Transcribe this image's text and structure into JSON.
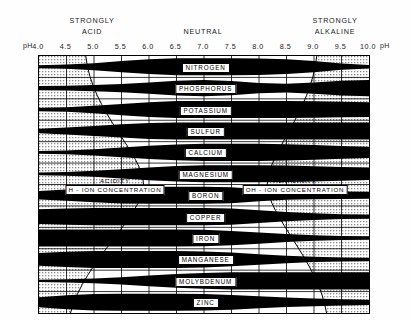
{
  "header": {
    "left_zone": "STRONGLY\nACID",
    "left_zone_line1": "STRONGLY",
    "left_zone_line2": "ACID",
    "center_zone": "NEUTRAL",
    "right_zone_line1": "STRONGLY",
    "right_zone_line2": "ALKALINE",
    "ph_label_left": "pH",
    "ph_label_right": "pH"
  },
  "axis": {
    "label": "pH",
    "ticks": [
      "4.0",
      "4.5",
      "5.0",
      "5.5",
      "6.0",
      "6.5",
      "7.0",
      "7.5",
      "8.0",
      "8.5",
      "9.0",
      "9.5",
      "10.0"
    ],
    "min": 4.0,
    "max": 10.0,
    "step": 0.5
  },
  "bands": [
    {
      "name": "NITROGEN",
      "label": "NITROGEN"
    },
    {
      "name": "PHOSPHORUS",
      "label": "PHOSPHORUS"
    },
    {
      "name": "POTASSIUM",
      "label": "POTASSIUM"
    },
    {
      "name": "SULFUR",
      "label": "SULFUR"
    },
    {
      "name": "CALCIUM",
      "label": "CALCIUM"
    },
    {
      "name": "MAGNESIUM",
      "label": "MAGNESIUM"
    },
    {
      "name": "BORON",
      "label": "BORON"
    },
    {
      "name": "COPPER",
      "label": "COPPER"
    },
    {
      "name": "IRON",
      "label": "IRON"
    },
    {
      "name": "MANGANESE",
      "label": "MANGANESE"
    },
    {
      "name": "MOLYBDENUM",
      "label": "MOLYBDENUM"
    },
    {
      "name": "ZINC",
      "label": "ZINC"
    }
  ],
  "legend": {
    "acidity": "ACIDITY",
    "h_ion": "H - ION CONCENTRATION",
    "alkalinity": "ALKALINITY",
    "oh_ion": "OH - ION CONCENTRATION"
  },
  "colors": {
    "band_fill": "#000000",
    "stipple": "#b9b9b9",
    "background": "#ffffff",
    "text": "#000000"
  },
  "chart_data": {
    "type": "area",
    "xlabel": "pH",
    "ylabel": "",
    "xlim": [
      4.0,
      10.0
    ],
    "grid": true,
    "legend_position": "none",
    "note": "Band thickness indicates relative availability of each plant nutrient at a given soil pH. Wider (thicker) black band = greater availability.",
    "x": [
      4.0,
      4.5,
      5.0,
      5.5,
      6.0,
      6.5,
      7.0,
      7.5,
      8.0,
      8.5,
      9.0,
      9.5,
      10.0
    ],
    "series": [
      {
        "name": "NITROGEN",
        "values": [
          0.1,
          0.18,
          0.35,
          0.62,
          0.85,
          1.0,
          1.0,
          1.0,
          0.95,
          0.85,
          0.62,
          0.3,
          0.12
        ]
      },
      {
        "name": "PHOSPHORUS",
        "values": [
          0.18,
          0.22,
          0.3,
          0.42,
          0.62,
          0.85,
          0.95,
          0.8,
          0.55,
          0.45,
          0.62,
          0.85,
          0.95
        ]
      },
      {
        "name": "POTASSIUM",
        "values": [
          0.12,
          0.2,
          0.38,
          0.62,
          0.85,
          1.0,
          1.0,
          1.0,
          1.0,
          1.0,
          0.95,
          0.9,
          0.85
        ]
      },
      {
        "name": "SULFUR",
        "values": [
          0.2,
          0.35,
          0.55,
          0.75,
          0.92,
          1.0,
          1.0,
          1.0,
          1.0,
          1.0,
          1.0,
          1.0,
          1.0
        ]
      },
      {
        "name": "CALCIUM",
        "values": [
          0.08,
          0.15,
          0.3,
          0.52,
          0.75,
          0.92,
          1.0,
          1.0,
          1.0,
          0.95,
          0.85,
          0.72,
          0.62
        ]
      },
      {
        "name": "MAGNESIUM",
        "values": [
          0.08,
          0.14,
          0.28,
          0.5,
          0.72,
          0.9,
          1.0,
          1.0,
          1.0,
          0.95,
          0.88,
          0.78,
          0.7
        ]
      },
      {
        "name": "BORON",
        "values": [
          0.45,
          0.62,
          0.8,
          0.95,
          1.0,
          1.0,
          1.0,
          0.92,
          0.68,
          0.5,
          0.42,
          0.38,
          0.35
        ]
      },
      {
        "name": "COPPER",
        "values": [
          0.85,
          0.95,
          1.0,
          1.0,
          1.0,
          1.0,
          1.0,
          0.95,
          0.72,
          0.48,
          0.32,
          0.22,
          0.18
        ]
      },
      {
        "name": "IRON",
        "values": [
          1.0,
          1.0,
          1.0,
          1.0,
          1.0,
          1.0,
          0.95,
          0.82,
          0.62,
          0.42,
          0.26,
          0.16,
          0.12
        ]
      },
      {
        "name": "MANGANESE",
        "values": [
          0.72,
          0.88,
          1.0,
          1.0,
          1.0,
          1.0,
          0.92,
          0.78,
          0.58,
          0.38,
          0.24,
          0.16,
          0.12
        ]
      },
      {
        "name": "MOLYBDENUM",
        "values": [
          0.05,
          0.1,
          0.22,
          0.38,
          0.58,
          0.78,
          0.92,
          1.0,
          1.0,
          1.0,
          1.0,
          1.0,
          1.0
        ]
      },
      {
        "name": "ZINC",
        "values": [
          0.55,
          0.8,
          0.95,
          1.0,
          1.0,
          1.0,
          0.95,
          0.85,
          0.68,
          0.52,
          0.4,
          0.3,
          0.24
        ]
      }
    ]
  }
}
